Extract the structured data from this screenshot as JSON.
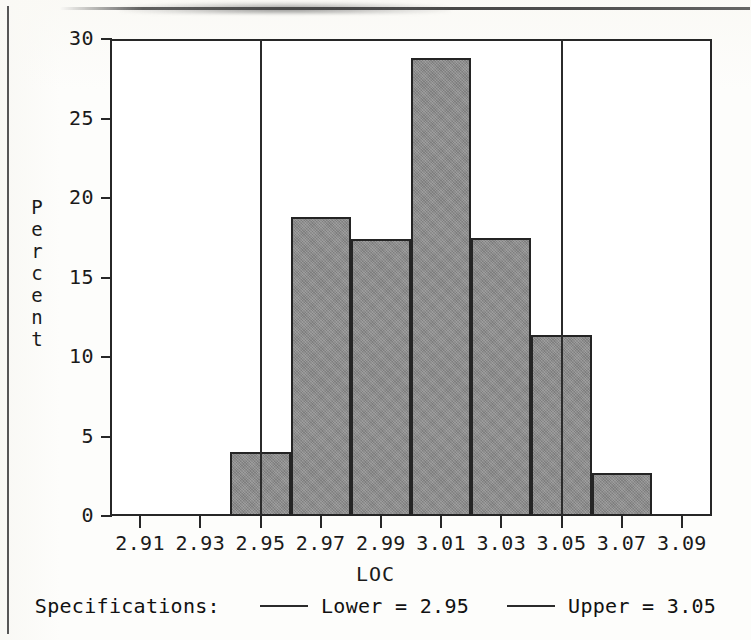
{
  "chart_data": {
    "type": "bar",
    "title": "",
    "xlabel": "LOC",
    "ylabel": "Percent",
    "ylabel_letters": [
      "P",
      "e",
      "r",
      "c",
      "e",
      "n",
      "t"
    ],
    "xlim": [
      2.9,
      3.1
    ],
    "ylim": [
      0,
      30
    ],
    "grid": false,
    "bin_width": 0.01,
    "bar_color": "#8a8a8a",
    "bar_edge_color": "#242424",
    "x_tick_labels": [
      "2.91",
      "2.93",
      "2.95",
      "2.97",
      "2.99",
      "3.01",
      "3.03",
      "3.05",
      "3.07",
      "3.09"
    ],
    "x_tick_values": [
      2.91,
      2.93,
      2.95,
      2.97,
      2.99,
      3.01,
      3.03,
      3.05,
      3.07,
      3.09
    ],
    "y_tick_labels": [
      "30",
      "25",
      "20",
      "15",
      "10",
      "5",
      "0"
    ],
    "y_tick_values": [
      30,
      25,
      20,
      15,
      10,
      5,
      0
    ],
    "bin_edges": [
      2.94,
      2.96,
      2.98,
      3.0,
      3.02,
      3.04,
      3.06,
      3.08
    ],
    "bin_centers": [
      2.95,
      2.97,
      2.99,
      3.01,
      3.03,
      3.05,
      3.07
    ],
    "categories": [
      "2.94-2.96",
      "2.96-2.98",
      "2.98-3.00",
      "3.00-3.02",
      "3.02-3.04",
      "3.04-3.06",
      "3.06-3.08"
    ],
    "values": [
      4.0,
      18.8,
      17.4,
      28.8,
      17.5,
      11.4,
      2.7
    ],
    "annotations": [
      {
        "name": "lower-spec-line",
        "label": "Lower = 2.95",
        "value": 2.95,
        "orientation": "vertical",
        "color": "#2b2b2b"
      },
      {
        "name": "upper-spec-line",
        "label": "Upper = 3.05",
        "value": 3.05,
        "orientation": "vertical",
        "color": "#2b2b2b"
      }
    ],
    "legend": {
      "position": "bottom",
      "title": "Specifications:",
      "entries": [
        {
          "label": "Lower = 2.95",
          "color": "#2b2b2b"
        },
        {
          "label": "Upper = 3.05",
          "color": "#2b2b2b"
        }
      ]
    }
  },
  "axes": {
    "y_ticks": [
      {
        "label": "30",
        "value": 30
      },
      {
        "label": "25",
        "value": 25
      },
      {
        "label": "20",
        "value": 20
      },
      {
        "label": "15",
        "value": 15
      },
      {
        "label": "10",
        "value": 10
      },
      {
        "label": "5",
        "value": 5
      },
      {
        "label": "0",
        "value": 0
      }
    ],
    "x_ticks": [
      {
        "label": "2.91",
        "value": 2.91
      },
      {
        "label": "2.93",
        "value": 2.93
      },
      {
        "label": "2.95",
        "value": 2.95
      },
      {
        "label": "2.97",
        "value": 2.97
      },
      {
        "label": "2.99",
        "value": 2.99
      },
      {
        "label": "3.01",
        "value": 3.01
      },
      {
        "label": "3.03",
        "value": 3.03
      },
      {
        "label": "3.05",
        "value": 3.05
      },
      {
        "label": "3.07",
        "value": 3.07
      },
      {
        "label": "3.09",
        "value": 3.09
      }
    ],
    "x_axis_title": "LOC",
    "y_axis_title": "Percent"
  },
  "legend": {
    "title": "Specifications:",
    "lower_label": "Lower = 2.95",
    "upper_label": "Upper = 3.05"
  }
}
